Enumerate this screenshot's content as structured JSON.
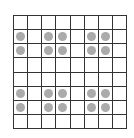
{
  "grid": {
    "rows": 8,
    "cols": 8,
    "line_color": "#333333",
    "dot_color": "#ababab",
    "cells": [
      [
        0,
        0,
        0,
        0,
        0,
        0,
        0,
        0
      ],
      [
        1,
        0,
        1,
        1,
        0,
        1,
        1,
        0
      ],
      [
        1,
        0,
        1,
        1,
        0,
        1,
        1,
        0
      ],
      [
        0,
        0,
        0,
        0,
        0,
        0,
        0,
        0
      ],
      [
        0,
        0,
        0,
        0,
        0,
        0,
        0,
        0
      ],
      [
        1,
        0,
        1,
        1,
        0,
        1,
        1,
        0
      ],
      [
        1,
        0,
        1,
        1,
        0,
        1,
        1,
        0
      ],
      [
        0,
        0,
        0,
        0,
        0,
        0,
        0,
        0
      ]
    ]
  }
}
